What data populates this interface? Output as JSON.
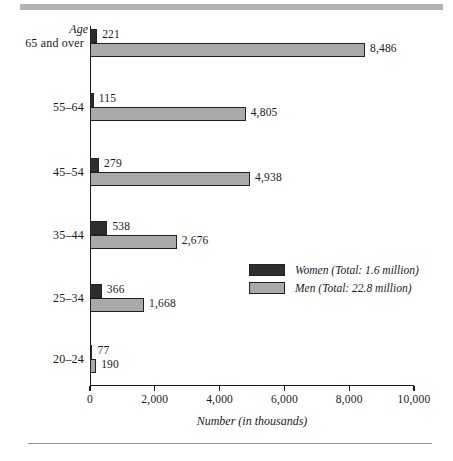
{
  "chart_data": {
    "type": "bar",
    "orientation": "horizontal",
    "title": "",
    "xlabel": "Number (in thousands)",
    "ylabel": "Age",
    "xlim": [
      0,
      10000
    ],
    "xticks": [
      "0",
      "2,000",
      "4,000",
      "6,000",
      "8,000",
      "10,000"
    ],
    "xtick_values": [
      0,
      2000,
      4000,
      6000,
      8000,
      10000
    ],
    "grid": false,
    "legend_position": "inside-right",
    "categories": [
      "65 and over",
      "55–64",
      "45–54",
      "35–44",
      "25–34",
      "20–24"
    ],
    "series": [
      {
        "name": "Women (Total:  1.6 million)",
        "short_name": "Women",
        "color": "#2e2e2e",
        "values": [
          221,
          115,
          279,
          538,
          366,
          77
        ],
        "labels": [
          "221",
          "115",
          "279",
          "538",
          "366",
          "77"
        ]
      },
      {
        "name": "Men (Total:  22.8 million)",
        "short_name": "Men",
        "color": "#a9a9a9",
        "values": [
          8486,
          4805,
          4938,
          2676,
          1668,
          190
        ],
        "labels": [
          "8,486",
          "4,805",
          "4,938",
          "2,676",
          "1,668",
          "190"
        ]
      }
    ]
  },
  "legend": {
    "items": [
      {
        "label": "Women (Total:  1.6 million)",
        "swatch": "women"
      },
      {
        "label": "Men (Total:  22.8 million)",
        "swatch": "men"
      }
    ]
  }
}
